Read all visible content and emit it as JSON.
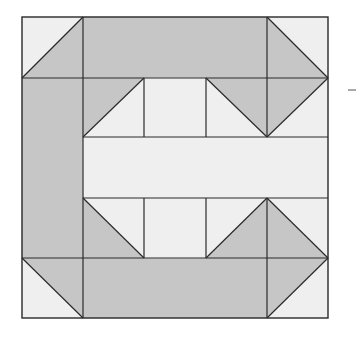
{
  "diagram": {
    "type": "quilt-block",
    "colors": {
      "dark": "#c6c6c6",
      "light": "#efefef",
      "stroke": "#2a2a2a",
      "background": "#ffffff"
    },
    "grid": {
      "x": [
        22,
        83,
        144,
        206,
        267,
        328
      ],
      "y": [
        17,
        78,
        137,
        198,
        258,
        318
      ]
    },
    "shapes": [
      {
        "id": "tl-corner-light",
        "fill": "light",
        "points": "22,17 83,17 22,78"
      },
      {
        "id": "tl-corner-dark",
        "fill": "dark",
        "points": "83,17 83,78 22,78"
      },
      {
        "id": "top-bar",
        "fill": "dark",
        "points": "83,17 267,17 267,78 83,78"
      },
      {
        "id": "tr-corner-dark",
        "fill": "dark",
        "points": "267,17 328,78 267,78"
      },
      {
        "id": "tr-corner-light",
        "fill": "light",
        "points": "267,17 328,17 328,78"
      },
      {
        "id": "left-bar",
        "fill": "dark",
        "points": "22,78 83,78 83,258 22,258"
      },
      {
        "id": "bl-corner-dark",
        "fill": "dark",
        "points": "22,258 83,258 83,318"
      },
      {
        "id": "bl-corner-light",
        "fill": "light",
        "points": "22,258 83,318 22,318"
      },
      {
        "id": "bottom-bar",
        "fill": "dark",
        "points": "83,258 267,258 267,318 83,318"
      },
      {
        "id": "br-corner-dark",
        "fill": "dark",
        "points": "267,258 328,258 267,318"
      },
      {
        "id": "br-corner-light",
        "fill": "light",
        "points": "328,258 328,318 267,318"
      },
      {
        "id": "inner-tl-dark",
        "fill": "dark",
        "points": "83,78 144,78 83,137"
      },
      {
        "id": "inner-tl-light",
        "fill": "light",
        "points": "144,78 144,137 83,137"
      },
      {
        "id": "inner-top-mid",
        "fill": "light",
        "points": "144,78 206,78 206,137 144,137"
      },
      {
        "id": "inner-tr-left-light",
        "fill": "light",
        "points": "206,78 206,137 267,137"
      },
      {
        "id": "inner-tr-left-dark",
        "fill": "dark",
        "points": "206,78 267,78 267,137"
      },
      {
        "id": "inner-tr-right-dark",
        "fill": "dark",
        "points": "267,78 328,78 267,137"
      },
      {
        "id": "inner-tr-right-light",
        "fill": "light",
        "points": "328,78 328,137 267,137"
      },
      {
        "id": "center-bar",
        "fill": "light",
        "points": "83,137 328,137 328,198 83,198"
      },
      {
        "id": "inner-bl-dark",
        "fill": "dark",
        "points": "83,198 144,258 83,258"
      },
      {
        "id": "inner-bl-light",
        "fill": "light",
        "points": "83,198 144,198 144,258"
      },
      {
        "id": "inner-bot-mid",
        "fill": "light",
        "points": "144,198 206,198 206,258 144,258"
      },
      {
        "id": "inner-br-left-light",
        "fill": "light",
        "points": "206,198 267,198 206,258"
      },
      {
        "id": "inner-br-left-dark",
        "fill": "dark",
        "points": "267,198 267,258 206,258"
      },
      {
        "id": "inner-br-right-dark",
        "fill": "dark",
        "points": "267,198 328,258 267,258"
      },
      {
        "id": "inner-br-right-light",
        "fill": "light",
        "points": "267,198 328,198 328,258"
      }
    ],
    "lines": [
      {
        "x1": 83,
        "y1": 17,
        "x2": 83,
        "y2": 318
      },
      {
        "x1": 267,
        "y1": 17,
        "x2": 267,
        "y2": 137
      },
      {
        "x1": 267,
        "y1": 198,
        "x2": 267,
        "y2": 318
      },
      {
        "x1": 144,
        "y1": 78,
        "x2": 144,
        "y2": 137
      },
      {
        "x1": 206,
        "y1": 78,
        "x2": 206,
        "y2": 137
      },
      {
        "x1": 144,
        "y1": 198,
        "x2": 144,
        "y2": 258
      },
      {
        "x1": 206,
        "y1": 198,
        "x2": 206,
        "y2": 258
      },
      {
        "x1": 22,
        "y1": 78,
        "x2": 328,
        "y2": 78
      },
      {
        "x1": 83,
        "y1": 137,
        "x2": 328,
        "y2": 137
      },
      {
        "x1": 83,
        "y1": 198,
        "x2": 328,
        "y2": 198
      },
      {
        "x1": 22,
        "y1": 258,
        "x2": 328,
        "y2": 258
      },
      {
        "x1": 22,
        "y1": 78,
        "x2": 83,
        "y2": 17
      },
      {
        "x1": 267,
        "y1": 17,
        "x2": 328,
        "y2": 78
      },
      {
        "x1": 83,
        "y1": 137,
        "x2": 144,
        "y2": 78
      },
      {
        "x1": 206,
        "y1": 78,
        "x2": 267,
        "y2": 137
      },
      {
        "x1": 267,
        "y1": 137,
        "x2": 328,
        "y2": 78
      },
      {
        "x1": 83,
        "y1": 198,
        "x2": 144,
        "y2": 258
      },
      {
        "x1": 206,
        "y1": 258,
        "x2": 267,
        "y2": 198
      },
      {
        "x1": 267,
        "y1": 198,
        "x2": 328,
        "y2": 258
      },
      {
        "x1": 22,
        "y1": 258,
        "x2": 83,
        "y2": 318
      },
      {
        "x1": 267,
        "y1": 318,
        "x2": 328,
        "y2": 258
      }
    ],
    "outer_border": {
      "x": 22,
      "y": 17,
      "width": 306,
      "height": 301
    },
    "side_mark": {
      "x1": 348,
      "y1": 90,
      "x2": 356,
      "y2": 90
    }
  }
}
